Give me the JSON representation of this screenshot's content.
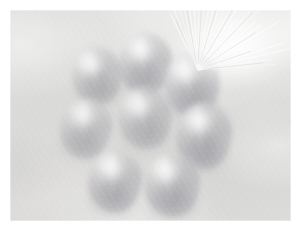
{
  "image": {
    "kind": "photograph",
    "mode": "grayscale",
    "caption": "Low-contrast grayscale photograph of eight rounded produce items arranged in a diagonal cluster on a pale cloth surface, with a bright radiating fan of fine fibres at the upper right",
    "canvas": {
      "width": 302,
      "height": 231
    },
    "border": {
      "color": "#ffffff",
      "width": 10
    },
    "plate": {
      "x": 10,
      "y": 10,
      "width": 281,
      "height": 211
    },
    "palette": {
      "border": "#ffffff",
      "background_light": "#dcdcda",
      "background_mid": "#d4d4d2",
      "background_shadow": "#c6c6c6",
      "object_mid": "#bdbdc0",
      "object_shadow": "#aeaeb4",
      "highlight": "#ffffff"
    },
    "objects": [
      {
        "name": "produce-top-left",
        "x": 62,
        "y": 36,
        "w": 50,
        "h": 58,
        "rot": -8,
        "tone": 0.66
      },
      {
        "name": "produce-top-center",
        "x": 108,
        "y": 22,
        "w": 54,
        "h": 62,
        "rot": 4,
        "tone": 0.78
      },
      {
        "name": "produce-top-right",
        "x": 154,
        "y": 42,
        "w": 56,
        "h": 64,
        "rot": -4,
        "tone": 0.82
      },
      {
        "name": "produce-mid-left",
        "x": 50,
        "y": 88,
        "w": 52,
        "h": 60,
        "rot": 10,
        "tone": 0.58
      },
      {
        "name": "produce-mid-center",
        "x": 108,
        "y": 76,
        "w": 54,
        "h": 62,
        "rot": -6,
        "tone": 0.62
      },
      {
        "name": "produce-mid-right",
        "x": 166,
        "y": 92,
        "w": 56,
        "h": 66,
        "rot": 2,
        "tone": 0.88
      },
      {
        "name": "produce-bottom-left",
        "x": 78,
        "y": 140,
        "w": 54,
        "h": 62,
        "rot": 6,
        "tone": 0.8
      },
      {
        "name": "produce-bottom-right",
        "x": 134,
        "y": 142,
        "w": 56,
        "h": 64,
        "rot": -3,
        "tone": 0.84
      }
    ],
    "fan": {
      "name": "radiating-fibre-fan",
      "origin": {
        "x": 188,
        "y": 60
      },
      "ray_count": 26,
      "angle_start_deg": -116,
      "angle_end_deg": -4,
      "length_min": 34,
      "length_max": 96,
      "color": "#ffffff"
    }
  }
}
